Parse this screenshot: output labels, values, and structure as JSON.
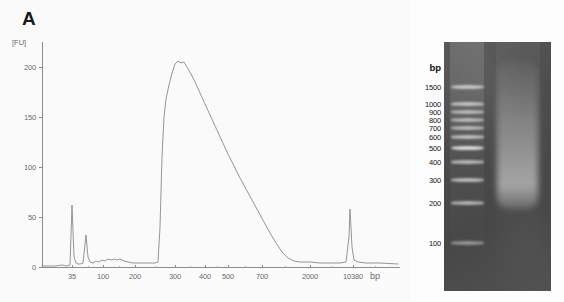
{
  "panels": {
    "a": {
      "letter": "A"
    },
    "b": {
      "letter": "B"
    }
  },
  "chart_data": {
    "type": "line",
    "title": "",
    "xlabel": "bp",
    "ylabel": "[FU]",
    "ylim": [
      0,
      225
    ],
    "xtick_labels": [
      "35",
      "100",
      "200",
      "300",
      "400",
      "500",
      "700",
      "2000",
      "10380"
    ],
    "ytick_labels": [
      "0",
      "50",
      "100",
      "150",
      "200"
    ],
    "ytick_values": [
      0,
      50,
      100,
      150,
      200
    ],
    "grid": false,
    "legend": "none",
    "annotations": [
      {
        "name": "lower-marker",
        "bp": 35,
        "fu": 62
      },
      {
        "name": "internal-peak",
        "bp": 65,
        "fu": 32
      },
      {
        "name": "library-main-peak",
        "bp": 300,
        "fu": 206
      },
      {
        "name": "upper-marker",
        "bp": 10380,
        "fu": 58
      }
    ],
    "series": [
      {
        "name": "fluorescence",
        "points": [
          [
            42,
            1
          ],
          [
            55,
            1
          ],
          [
            62,
            2
          ],
          [
            66,
            1
          ],
          [
            70,
            2
          ],
          [
            72,
            62
          ],
          [
            74,
            10
          ],
          [
            76,
            4
          ],
          [
            78,
            3
          ],
          [
            80,
            3
          ],
          [
            83,
            4
          ],
          [
            86,
            32
          ],
          [
            88,
            10
          ],
          [
            90,
            5
          ],
          [
            93,
            4
          ],
          [
            96,
            6
          ],
          [
            99,
            5
          ],
          [
            102,
            7
          ],
          [
            105,
            6
          ],
          [
            108,
            8
          ],
          [
            111,
            7
          ],
          [
            114,
            8
          ],
          [
            117,
            7
          ],
          [
            120,
            8
          ],
          [
            124,
            6
          ],
          [
            128,
            5
          ],
          [
            133,
            4
          ],
          [
            140,
            4
          ],
          [
            148,
            4
          ],
          [
            155,
            4
          ],
          [
            158,
            5
          ],
          [
            160,
            40
          ],
          [
            162,
            110
          ],
          [
            164,
            150
          ],
          [
            166,
            168
          ],
          [
            169,
            182
          ],
          [
            172,
            194
          ],
          [
            175,
            203
          ],
          [
            178,
            206
          ],
          [
            181,
            204
          ],
          [
            184,
            205
          ],
          [
            187,
            200
          ],
          [
            191,
            193
          ],
          [
            195,
            185
          ],
          [
            200,
            174
          ],
          [
            205,
            163
          ],
          [
            210,
            152
          ],
          [
            216,
            139
          ],
          [
            222,
            126
          ],
          [
            228,
            113
          ],
          [
            234,
            101
          ],
          [
            240,
            89
          ],
          [
            246,
            78
          ],
          [
            252,
            67
          ],
          [
            258,
            56
          ],
          [
            264,
            45
          ],
          [
            270,
            34
          ],
          [
            276,
            24
          ],
          [
            282,
            15
          ],
          [
            288,
            9
          ],
          [
            294,
            6
          ],
          [
            300,
            5
          ],
          [
            310,
            5
          ],
          [
            320,
            4
          ],
          [
            330,
            4
          ],
          [
            340,
            4
          ],
          [
            346,
            5
          ],
          [
            349,
            30
          ],
          [
            350,
            58
          ],
          [
            352,
            20
          ],
          [
            354,
            7
          ],
          [
            358,
            5
          ],
          [
            366,
            4
          ],
          [
            380,
            4
          ],
          [
            398,
            3
          ]
        ]
      }
    ]
  },
  "gel": {
    "bp_title": "bp",
    "ladder_labels": [
      "1500",
      "1000",
      "900",
      "800",
      "700",
      "600",
      "500",
      "400",
      "300",
      "200",
      "100"
    ],
    "ladder_bands": [
      {
        "label": "1500",
        "y": 87,
        "thickness": 4.0,
        "brightness": 0.82
      },
      {
        "label": "1000",
        "y": 104,
        "thickness": 3.6,
        "brightness": 0.8
      },
      {
        "label": "900",
        "y": 112,
        "thickness": 3.4,
        "brightness": 0.72
      },
      {
        "label": "800",
        "y": 120,
        "thickness": 3.4,
        "brightness": 0.72
      },
      {
        "label": "700",
        "y": 128,
        "thickness": 3.4,
        "brightness": 0.72
      },
      {
        "label": "600",
        "y": 137,
        "thickness": 3.6,
        "brightness": 0.78
      },
      {
        "label": "500",
        "y": 148,
        "thickness": 4.6,
        "brightness": 1.0
      },
      {
        "label": "400",
        "y": 162,
        "thickness": 3.6,
        "brightness": 0.74
      },
      {
        "label": "300",
        "y": 180,
        "thickness": 3.8,
        "brightness": 0.76
      },
      {
        "label": "200",
        "y": 203,
        "thickness": 3.6,
        "brightness": 0.7
      },
      {
        "label": "100",
        "y": 243,
        "thickness": 3.4,
        "brightness": 0.52
      }
    ],
    "sample_smear": {
      "name": "library-smear",
      "top": 60,
      "height": 150,
      "peak_center": 185,
      "description": "broad smear centered near 300 bp"
    }
  },
  "colors": {
    "trace": "#8a8a8a",
    "axis": "#8d8d8d",
    "axis_text": "#6b6b6b",
    "panel_letter": "#1a1a1a",
    "gel_background": "#4a4a4a",
    "band": "#d8d8d8",
    "page_background": "#fdfdfd"
  }
}
